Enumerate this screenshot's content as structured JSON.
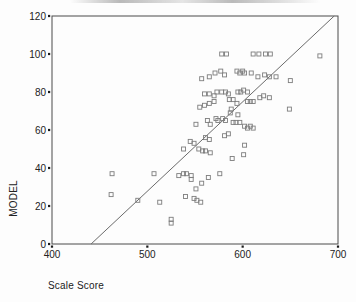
{
  "figure": {
    "background": "#fdfdfd",
    "axis_color": "#4a4a4a",
    "tick_color": "#1a1a1a",
    "text_color": "#222222"
  },
  "chart_data": {
    "type": "scatter",
    "title": "",
    "xlabel": "Scale Score",
    "ylabel": "MODEL",
    "xlim": [
      400,
      700
    ],
    "ylim": [
      0,
      120
    ],
    "xticks": [
      400,
      500,
      600,
      700
    ],
    "yticks": [
      0,
      20,
      40,
      60,
      80,
      100,
      120
    ],
    "grid": false,
    "legend": null,
    "marker": "open-square",
    "marker_color": "#7d7d7d",
    "line_color": "#6b6b6b",
    "fit_line": {
      "x1": 441,
      "y1": 0,
      "x2": 696,
      "y2": 120
    },
    "points": [
      [
        578,
        100
      ],
      [
        583,
        100
      ],
      [
        611,
        100
      ],
      [
        617,
        100
      ],
      [
        624,
        100
      ],
      [
        629,
        100
      ],
      [
        681,
        99
      ],
      [
        557,
        87
      ],
      [
        565,
        88
      ],
      [
        571,
        90
      ],
      [
        577,
        91
      ],
      [
        581,
        89
      ],
      [
        594,
        91
      ],
      [
        597,
        90
      ],
      [
        600,
        91
      ],
      [
        602,
        90
      ],
      [
        609,
        90
      ],
      [
        616,
        88
      ],
      [
        623,
        89
      ],
      [
        628,
        88
      ],
      [
        635,
        88
      ],
      [
        650,
        86
      ],
      [
        560,
        79
      ],
      [
        565,
        79
      ],
      [
        570,
        78
      ],
      [
        573,
        80
      ],
      [
        578,
        80
      ],
      [
        582,
        80
      ],
      [
        585,
        79
      ],
      [
        595,
        80
      ],
      [
        598,
        80
      ],
      [
        601,
        81
      ],
      [
        605,
        80
      ],
      [
        618,
        77
      ],
      [
        622,
        78
      ],
      [
        628,
        77
      ],
      [
        555,
        72
      ],
      [
        560,
        73
      ],
      [
        565,
        74
      ],
      [
        570,
        75
      ],
      [
        586,
        76
      ],
      [
        590,
        76
      ],
      [
        594,
        74
      ],
      [
        588,
        71
      ],
      [
        605,
        75
      ],
      [
        608,
        75
      ],
      [
        611,
        75
      ],
      [
        649,
        71
      ],
      [
        587,
        69
      ],
      [
        551,
        63
      ],
      [
        563,
        65
      ],
      [
        566,
        63
      ],
      [
        572,
        66
      ],
      [
        574,
        65
      ],
      [
        579,
        66
      ],
      [
        582,
        65
      ],
      [
        590,
        64
      ],
      [
        593,
        64
      ],
      [
        595,
        68
      ],
      [
        597,
        64
      ],
      [
        602,
        62
      ],
      [
        605,
        61
      ],
      [
        608,
        62
      ],
      [
        611,
        61
      ],
      [
        581,
        57
      ],
      [
        585,
        58
      ],
      [
        561,
        56
      ],
      [
        565,
        55
      ],
      [
        545,
        54
      ],
      [
        549,
        53
      ],
      [
        538,
        50
      ],
      [
        554,
        50
      ],
      [
        558,
        49
      ],
      [
        561,
        49
      ],
      [
        566,
        48
      ],
      [
        602,
        52
      ],
      [
        601,
        47
      ],
      [
        589,
        45
      ],
      [
        463,
        37
      ],
      [
        507,
        37
      ],
      [
        533,
        36
      ],
      [
        538,
        37
      ],
      [
        541,
        37
      ],
      [
        546,
        36
      ],
      [
        546,
        34
      ],
      [
        576,
        37
      ],
      [
        564,
        35
      ],
      [
        557,
        32
      ],
      [
        551,
        29
      ],
      [
        540,
        25
      ],
      [
        549,
        24
      ],
      [
        552,
        23
      ],
      [
        556,
        22
      ],
      [
        513,
        22
      ],
      [
        462,
        26
      ],
      [
        490,
        23
      ],
      [
        525,
        13
      ],
      [
        525,
        11
      ]
    ]
  }
}
